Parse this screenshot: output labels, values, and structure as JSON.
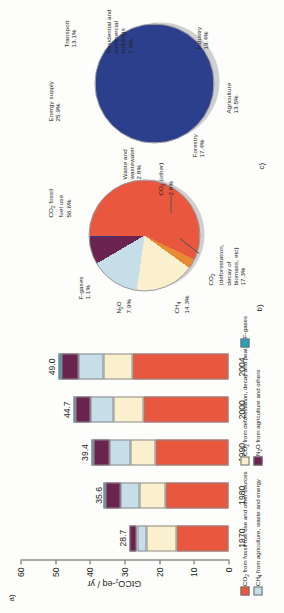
{
  "figure": {
    "panels": [
      {
        "tag": "a)"
      },
      {
        "tag": "b)"
      },
      {
        "tag": "c)"
      }
    ]
  },
  "chart_data": [
    {
      "type": "bar",
      "panel": "a)",
      "title": "",
      "stacked": true,
      "xlabel": "",
      "ylabel": "GtCO2-eq / yr",
      "ylabel_parts": {
        "pre": "GtCO",
        "sub": "2",
        "post": "-eq / yr"
      },
      "ylim": [
        0,
        60
      ],
      "yticks": [
        0,
        10,
        20,
        30,
        40,
        50,
        60
      ],
      "grid": false,
      "categories": [
        "1970",
        "1980",
        "1990",
        "2000",
        "2004"
      ],
      "totals": [
        28.7,
        35.6,
        39.4,
        44.7,
        49.0
      ],
      "total_labels": [
        "28.7",
        "35.6",
        "39.4",
        "44.7",
        "49.0"
      ],
      "series": [
        {
          "name": "CO2 from fossil fuel use and other sources",
          "color": "#E9573F",
          "values": [
            15.0,
            18.2,
            21.0,
            24.6,
            27.7
          ]
        },
        {
          "name": "CO2 from deforestation, decay and peat",
          "color": "#FAF0CD",
          "values": [
            8.8,
            7.4,
            7.3,
            8.5,
            8.5
          ]
        },
        {
          "name": "CH4 from agriculture, waste and energy",
          "color": "#C6DEE8",
          "values": [
            2.6,
            5.7,
            6.1,
            6.6,
            7.1
          ]
        },
        {
          "name": "N2O from agriculture and others",
          "color": "#6B2350",
          "values": [
            2.3,
            4.1,
            4.6,
            4.4,
            5.0
          ]
        },
        {
          "name": "F-gases",
          "color": "#2E9FB8",
          "values": [
            0.0,
            0.2,
            0.4,
            0.6,
            0.7
          ]
        }
      ],
      "legend": {
        "position": "bottom",
        "entries": [
          {
            "label": "CO2 from fossil fuel use and other sources",
            "parts": {
              "pre": "CO",
              "sub": "2",
              "post": " from fossil fuel use and other sources"
            },
            "color": "#E9573F"
          },
          {
            "label": "CO2 from deforestation, decay and peat",
            "parts": {
              "pre": "CO",
              "sub": "2",
              "post": " from deforestation, decay and peat"
            },
            "color": "#FAF0CD"
          },
          {
            "label": "F-gases",
            "parts": {
              "pre": "F-gases",
              "sub": "",
              "post": ""
            },
            "color": "#2E9FB8"
          },
          {
            "label": "CH4 from agriculture, waste and energy",
            "parts": {
              "pre": "CH",
              "sub": "4",
              "post": " from agriculture, waste and energy"
            },
            "color": "#C6DEE8"
          },
          {
            "label": "N2O from agriculture and others",
            "parts": {
              "pre": "N",
              "sub": "2",
              "post": "O from agriculture and others"
            },
            "color": "#6B2350"
          }
        ]
      }
    },
    {
      "type": "pie",
      "panel": "b)",
      "title": "",
      "slices": [
        {
          "label": "CO2 fossil fuel use",
          "label_l1": "CO2 fossil",
          "label_l2": "fuel use",
          "value": 56.6,
          "value_label": "56.6%",
          "color": "#E9573F"
        },
        {
          "label": "CO2 (other)",
          "label_l1": "CO2 (other)",
          "label_l2": "",
          "value": 2.8,
          "value_label": "2.8%",
          "color": "#E88A32"
        },
        {
          "label": "CO2 (deforestation, decay of biomass, etc)",
          "label_l1": "CO2",
          "label_l2": "(deforestation,",
          "label_l3": "decay of",
          "label_l4": "biomass, etc)",
          "value": 17.3,
          "value_label": "17.3%",
          "color": "#FAF0CD"
        },
        {
          "label": "CH4",
          "label_l1": "CH4",
          "label_l2": "",
          "value": 14.3,
          "value_label": "14.3%",
          "color": "#C6DEE8"
        },
        {
          "label": "N2O",
          "label_l1": "N2O",
          "label_l2": "",
          "value": 7.9,
          "value_label": "7.9%",
          "color": "#6B2350"
        },
        {
          "label": "F-gases",
          "label_l1": "F-gases",
          "label_l2": "",
          "value": 1.1,
          "value_label": "1.1%",
          "color": "#2B3F8C"
        }
      ]
    },
    {
      "type": "pie",
      "panel": "c)",
      "title": "",
      "slices": [
        {
          "label": "Energy supply",
          "value": 25.9,
          "value_label": "25.9%",
          "color": "#2B3F8C"
        },
        {
          "label": "Transport",
          "value": 13.1,
          "value_label": "13.1%",
          "color": "#F7D233"
        },
        {
          "label": "Residential and commercial buildings",
          "label_l1": "Residential and",
          "label_l2": "commercial buildings",
          "value": 7.9,
          "value_label": "7.9%",
          "color": "#A7A9AC"
        },
        {
          "label": "Industry",
          "value": 19.4,
          "value_label": "19.4%",
          "color": "#E8262B"
        },
        {
          "label": "Agriculture",
          "value": 13.5,
          "value_label": "13.5%",
          "color": "#A6CE39"
        },
        {
          "label": "Forestry",
          "value": 17.4,
          "value_label": "17.4%",
          "color": "#3A9E3E"
        },
        {
          "label": "Waste and wastewater",
          "label_l1": "Waste and wastewater",
          "value": 2.8,
          "value_label": "2.8%",
          "color": "#D9EAF5"
        }
      ]
    }
  ]
}
